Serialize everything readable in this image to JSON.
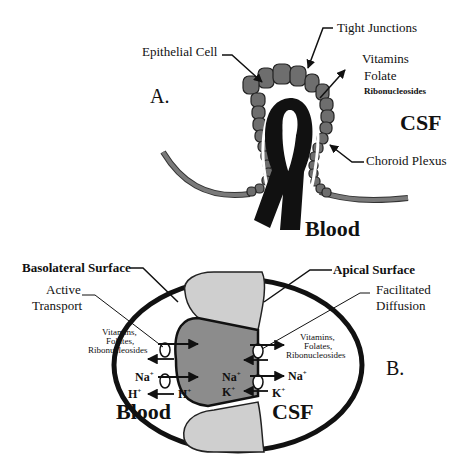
{
  "panel_a": {
    "label": "A.",
    "labels": {
      "epithelial_cell": "Epithelial Cell",
      "tight_junctions": "Tight Junctions",
      "vitamins": "Vitamins",
      "folate": "Folate",
      "ribonucleosides": "Ribonucleosides",
      "csf": "CSF",
      "choroid_plexus": "Choroid Plexus",
      "blood": "Blood"
    }
  },
  "panel_b": {
    "label": "B.",
    "labels": {
      "basolateral_surface": "Basolateral Surface",
      "apical_surface": "Apical Surface",
      "active_transport_line1": "Active",
      "active_transport_line2": "Transport",
      "facilitated_diffusion_line1": "Facilitated",
      "facilitated_diffusion_line2": "Diffusion",
      "left_substrates_line1": "Vitamins,",
      "left_substrates_line2": "Folates,",
      "left_substrates_line3": "Ribonucleosides",
      "right_substrates_line1": "Vitamins,",
      "right_substrates_line2": "Folates,",
      "right_substrates_line3": "Ribonucleosides",
      "na_left": "Na",
      "h_left": "H",
      "h_inner": "H",
      "na_inner": "Na",
      "k_inner": "K",
      "na_right": "Na",
      "k_right": "K",
      "plus": "+",
      "blood": "Blood",
      "csf": "CSF"
    }
  },
  "colors": {
    "cell_dark": "#6e6e6e",
    "cell_mid": "#9a9a9a",
    "cell_light": "#cfcfcf",
    "vessel": "#111111",
    "membrane_strand": "#7a7a7a"
  }
}
